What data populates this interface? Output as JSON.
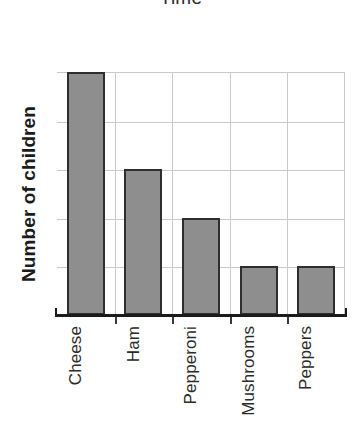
{
  "chart_data": {
    "type": "bar",
    "title": "Time",
    "xlabel": "",
    "ylabel": "Number of children",
    "categories": [
      "Cheese",
      "Ham",
      "Pepperoni",
      "Mushrooms",
      "Peppers"
    ],
    "values": [
      5,
      3,
      2,
      1,
      1
    ],
    "ylim": [
      0,
      5
    ],
    "ytick_values": [
      0,
      1,
      2,
      3,
      4,
      5
    ],
    "ytick_labels": [
      "",
      "",
      "",
      "",
      "",
      ""
    ],
    "grid": "horizontal-and-vertical",
    "legend": "none",
    "bar_fill_color": "#8e8e8e",
    "bar_border_color": "#2e2e2e",
    "gridline_color": "#c9c9c9",
    "axis_color": "#1b1b1b",
    "title_clipped_top": true,
    "xlabel_rotation_deg": -90,
    "ylabel_rotation_deg": -90
  }
}
